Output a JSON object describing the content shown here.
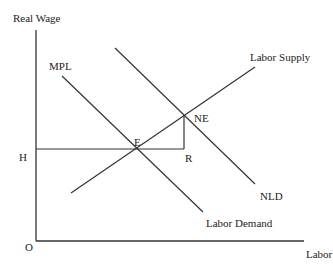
{
  "diagram": {
    "y_axis_label": "Real Wage",
    "x_axis_label": "Labor",
    "origin_label": "O",
    "wage_level_label": "H",
    "curves": {
      "mpl": "MPL",
      "labor_demand": "Labor Demand",
      "new_labor_demand": "NLD",
      "labor_supply": "Labor Supply"
    },
    "points": {
      "equilibrium": "E",
      "new_equilibrium": "NE",
      "r_point": "R"
    },
    "colors": {
      "line": "#333333",
      "text": "#222222"
    }
  }
}
